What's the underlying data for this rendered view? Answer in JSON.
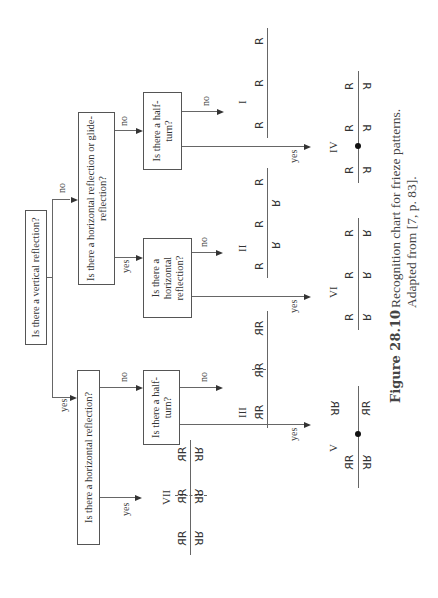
{
  "questions": {
    "root": "Is there a vertical reflection?",
    "left": "Is there a horizontal reflection?",
    "right": "Is there a horizontal reflection or glide-reflection?",
    "left_half_turn": "Is there a half-turn?",
    "mid_horizontal": "Is there a horizontal reflection?",
    "right_half_turn": "Is there a half-turn?"
  },
  "edge_labels": {
    "yes": "yes",
    "no": "no"
  },
  "patterns": {
    "I": {
      "numeral": "I",
      "glyph": "R"
    },
    "II": {
      "numeral": "II",
      "glyph": "R"
    },
    "III": {
      "numeral": "III",
      "glyph": "R"
    },
    "IV": {
      "numeral": "IV",
      "glyph": "R"
    },
    "V": {
      "numeral": "V",
      "glyph": "R"
    },
    "VI": {
      "numeral": "VI",
      "glyph": "R"
    },
    "VII": {
      "numeral": "VII",
      "glyph": "R"
    }
  },
  "caption": {
    "label": "Figure 28.10",
    "line1": "Recognition chart for frieze patterns.",
    "line2": "Adapted from [7, p. 83]."
  }
}
